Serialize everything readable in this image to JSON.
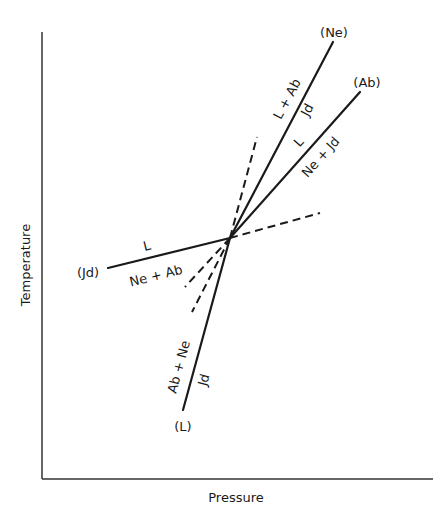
{
  "diagram": {
    "type": "phase-diagram-invariant-point",
    "axes": {
      "x_label": "Pressure",
      "y_label": "Temperature"
    },
    "invariant_point": "intersection of reactions (Ne), (Ab), (Jd), (L)",
    "reactions": [
      {
        "id": "Ne",
        "label": "(Ne)",
        "side_a": "L + Ab",
        "side_b": "Jd"
      },
      {
        "id": "Ab",
        "label": "(Ab)",
        "side_a": "L",
        "side_b": "Ne + Jd"
      },
      {
        "id": "Jd",
        "label": "(Jd)",
        "side_a": "L",
        "side_b": "Ne + Ab"
      },
      {
        "id": "L",
        "label": "(L)",
        "side_a": "Ab + Ne",
        "side_b": "Jd"
      }
    ],
    "metastable_extensions": 4
  }
}
